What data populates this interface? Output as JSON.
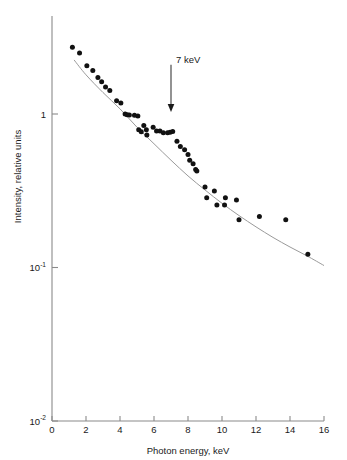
{
  "chart_data": {
    "type": "scatter",
    "title": "",
    "xlabel": "Photon energy, keV",
    "ylabel": "Intensity, relative units",
    "xscale": "linear",
    "yscale": "log",
    "xlim": [
      0,
      16
    ],
    "ylim": [
      0.01,
      4
    ],
    "grid": false,
    "legend": null,
    "xticks": [
      0,
      2,
      4,
      6,
      8,
      10,
      12,
      14,
      16
    ],
    "xticklabels": [
      "0",
      "2",
      "4",
      "6",
      "8",
      "10",
      "12",
      "14",
      "16"
    ],
    "yticks": [
      0.01,
      0.1,
      1
    ],
    "yticklabels": [
      "10",
      "10",
      "1"
    ],
    "ytick_exponents": [
      "-2",
      "-1",
      ""
    ],
    "annotations": [
      {
        "text": "7 keV",
        "x": 7,
        "y": 1.6,
        "arrow_to_x": 7,
        "arrow_to_y": 1.03,
        "kind": "down-arrow"
      }
    ],
    "series": [
      {
        "name": "measured spectrum",
        "type": "scatter",
        "marker": "filled-circle",
        "color": "#111111",
        "points": [
          [
            1.2,
            2.72
          ],
          [
            1.62,
            2.5
          ],
          [
            2.05,
            2.06
          ],
          [
            2.4,
            1.92
          ],
          [
            2.7,
            1.73
          ],
          [
            2.92,
            1.62
          ],
          [
            3.15,
            1.5
          ],
          [
            3.4,
            1.42
          ],
          [
            3.8,
            1.22
          ],
          [
            4.05,
            1.18
          ],
          [
            4.3,
            1.0
          ],
          [
            4.42,
            0.99
          ],
          [
            4.55,
            0.985
          ],
          [
            4.85,
            0.98
          ],
          [
            5.05,
            0.97
          ],
          [
            5.1,
            0.79
          ],
          [
            5.25,
            0.765
          ],
          [
            5.4,
            0.84
          ],
          [
            5.55,
            0.79
          ],
          [
            5.58,
            0.73
          ],
          [
            5.95,
            0.82
          ],
          [
            6.15,
            0.775
          ],
          [
            6.35,
            0.775
          ],
          [
            6.55,
            0.755
          ],
          [
            6.8,
            0.755
          ],
          [
            6.95,
            0.76
          ],
          [
            7.1,
            0.77
          ],
          [
            7.35,
            0.665
          ],
          [
            7.55,
            0.615
          ],
          [
            7.8,
            0.585
          ],
          [
            8.0,
            0.545
          ],
          [
            8.1,
            0.5
          ],
          [
            8.3,
            0.475
          ],
          [
            8.45,
            0.435
          ],
          [
            8.52,
            0.425
          ],
          [
            9.0,
            0.335
          ],
          [
            9.1,
            0.285
          ],
          [
            9.55,
            0.315
          ],
          [
            9.7,
            0.255
          ],
          [
            10.15,
            0.255
          ],
          [
            10.2,
            0.285
          ],
          [
            10.85,
            0.275
          ],
          [
            11.0,
            0.205
          ],
          [
            12.2,
            0.215
          ],
          [
            13.75,
            0.205
          ],
          [
            15.05,
            0.122
          ]
        ]
      },
      {
        "name": "fitted continuum",
        "type": "line",
        "color": "#9a9a9a",
        "points": [
          [
            1.3,
            2.25
          ],
          [
            2.0,
            1.8
          ],
          [
            3.0,
            1.38
          ],
          [
            4.0,
            1.08
          ],
          [
            5.0,
            0.82
          ],
          [
            6.0,
            0.64
          ],
          [
            7.0,
            0.5
          ],
          [
            8.0,
            0.395
          ],
          [
            9.0,
            0.32
          ],
          [
            10.0,
            0.262
          ],
          [
            11.0,
            0.218
          ],
          [
            12.0,
            0.184
          ],
          [
            13.0,
            0.157
          ],
          [
            14.0,
            0.136
          ],
          [
            15.0,
            0.119
          ],
          [
            16.0,
            0.103
          ]
        ]
      }
    ]
  },
  "figure": {
    "background_color": "#ffffff",
    "axis_color": "#8a8a8a",
    "marker_color": "#111111",
    "curve_color": "#9a9a9a"
  }
}
